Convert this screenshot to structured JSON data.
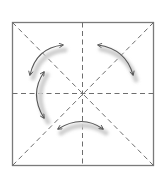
{
  "diagram": {
    "type": "origami-fold-diagram",
    "colors": {
      "background": "#ffffff",
      "border": "#7a7a7a",
      "crease": "#6e6e6e",
      "arrow": "#555555",
      "arrow_shadow": "#cfcfcf"
    },
    "square": {
      "x": 12,
      "y": 22,
      "width": 141,
      "height": 143
    },
    "crease_lines": [
      "diagonal-tl-br",
      "diagonal-tr-bl",
      "vertical-midline",
      "horizontal-midline"
    ],
    "arrows": [
      {
        "name": "top-left-arrow",
        "from": "lower-left",
        "to": "upper-right"
      },
      {
        "name": "top-right-arrow",
        "from": "upper-left",
        "to": "lower-right"
      },
      {
        "name": "left-arrow",
        "from": "top",
        "to": "bottom"
      },
      {
        "name": "bottom-arrow",
        "from": "left",
        "to": "right"
      }
    ]
  }
}
